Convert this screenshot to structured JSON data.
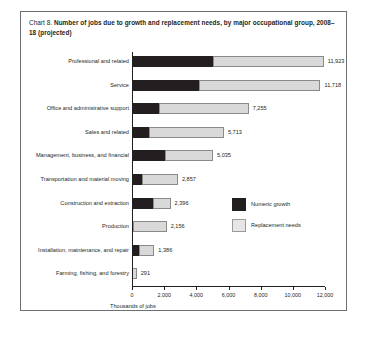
{
  "chart_label": "Chart 8.",
  "title_main": "Number of jobs due to growth and replacement needs, by major occupational group, 2008–18 (projected)",
  "legend": {
    "growth": "Numeric growth",
    "replacement": "Replacement needs"
  },
  "chart_data": {
    "type": "bar",
    "orientation": "horizontal",
    "stacked": true,
    "title": "Chart 8. Number of jobs due to growth and replacement needs, by major occupational group, 2008–18 (projected)",
    "xlabel": "Thousands of jobs",
    "ylabel": "",
    "xlim": [
      0,
      12000
    ],
    "xticks": [
      0,
      2000,
      4000,
      6000,
      8000,
      10000,
      12000
    ],
    "xtick_labels": [
      "0",
      "2,000",
      "4,000",
      "6,000",
      "8,000",
      "10,000",
      "12,000"
    ],
    "grid": false,
    "legend_position": "middle-right",
    "categories": [
      "Professional and related",
      "Service",
      "Office and administrative support",
      "Sales and related",
      "Management, business, and financial",
      "Transportation and material moving",
      "Construction and extraction",
      "Production",
      "Installation, maintenance, and repair",
      "Farming, fishing, and forestry"
    ],
    "series": [
      {
        "name": "Numeric growth",
        "color": "#231f20",
        "values": [
          5050,
          4190,
          1660,
          1060,
          2060,
          600,
          1310,
          50,
          440,
          10
        ]
      },
      {
        "name": "Replacement needs",
        "color": "#d9d9d9",
        "values": [
          6873,
          7528,
          5595,
          4653,
          2975,
          2257,
          1086,
          2106,
          946,
          281
        ]
      }
    ],
    "totals": [
      11923,
      11718,
      7255,
      5713,
      5035,
      2857,
      2396,
      2156,
      1386,
      291
    ],
    "total_labels": [
      "11,923",
      "11,718",
      "7,255",
      "5,713",
      "5,035",
      "2,857",
      "2,396",
      "2,156",
      "1,386",
      "291"
    ]
  }
}
